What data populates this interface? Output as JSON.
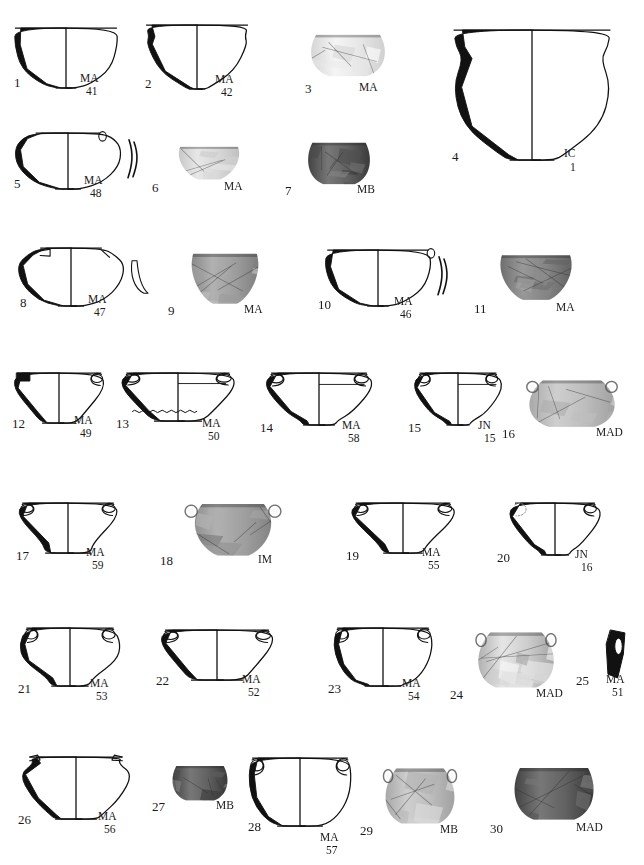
{
  "plate": {
    "header_fragment": "",
    "width": 644,
    "height": 865,
    "description": "Archaeological pottery catalogue plate: 30 vessels shown as section drawings or photographs",
    "site_codes": [
      "MA",
      "MB",
      "MAD",
      "IC",
      "IM",
      "JN"
    ]
  },
  "items": [
    {
      "num": "1",
      "site": "MA",
      "cat": "41",
      "kind": "drawing",
      "shape": "hemispherical-bowl",
      "x": 14,
      "y": 28,
      "w": 104,
      "h": 60,
      "numx": 0,
      "numy": 48,
      "sitex": 66,
      "sitey": 45,
      "catx": 72,
      "caty": 58
    },
    {
      "num": "2",
      "site": "MA",
      "cat": "42",
      "kind": "drawing",
      "shape": "carinated-bowl",
      "x": 145,
      "y": 25,
      "w": 104,
      "h": 64,
      "numx": 0,
      "numy": 52,
      "sitex": 70,
      "sitey": 49,
      "catx": 76,
      "caty": 62
    },
    {
      "num": "3",
      "site": "MA",
      "cat": "",
      "kind": "photo",
      "tone": "very-light",
      "shape": "jar-photo",
      "x": 305,
      "y": 30,
      "w": 86,
      "h": 48,
      "numx": 0,
      "numy": 52,
      "sitex": 54,
      "sitey": 52,
      "catx": 0,
      "caty": 0
    },
    {
      "num": "4",
      "site": "IC",
      "cat": "1",
      "kind": "drawing",
      "shape": "large-necked-jar",
      "x": 452,
      "y": 30,
      "w": 160,
      "h": 130,
      "numx": 0,
      "numy": 120,
      "sitex": 112,
      "sitey": 118,
      "catx": 118,
      "caty": 132
    },
    {
      "num": "5",
      "site": "MA",
      "cat": "48",
      "kind": "drawing",
      "shape": "lugged-bowl-profile",
      "x": 14,
      "y": 133,
      "w": 108,
      "h": 56,
      "numx": 0,
      "numy": 44,
      "sitex": 70,
      "sitey": 42,
      "catx": 76,
      "caty": 55
    },
    {
      "num": "6",
      "site": "MA",
      "cat": "",
      "kind": "photo",
      "tone": "light",
      "shape": "shallow-bowl-photo",
      "x": 170,
      "y": 143,
      "w": 78,
      "h": 38,
      "numx": -18,
      "numy": 38,
      "sitex": 54,
      "sitey": 38,
      "catx": 0,
      "caty": 0
    },
    {
      "num": "7",
      "site": "MB",
      "cat": "",
      "kind": "photo",
      "tone": "dark",
      "shape": "globular-pot-photo",
      "x": 303,
      "y": 138,
      "w": 72,
      "h": 48,
      "numx": -18,
      "numy": 46,
      "sitex": 54,
      "sitey": 46,
      "catx": 0,
      "caty": 0
    },
    {
      "num": "8",
      "site": "MA",
      "cat": "47",
      "kind": "drawing",
      "shape": "lug-handled-bowl",
      "x": 16,
      "y": 248,
      "w": 110,
      "h": 58,
      "numx": 4,
      "numy": 48,
      "sitex": 72,
      "sitey": 46,
      "catx": 78,
      "caty": 59
    },
    {
      "num": "9",
      "site": "MA",
      "cat": "",
      "kind": "photo",
      "tone": "mid",
      "shape": "footed-bowl-photo",
      "x": 182,
      "y": 248,
      "w": 86,
      "h": 58,
      "numx": -14,
      "numy": 56,
      "sitex": 62,
      "sitey": 56,
      "catx": 0,
      "caty": 0
    },
    {
      "num": "10",
      "site": "MA",
      "cat": "46",
      "kind": "drawing",
      "shape": "rim-handled-bowl",
      "x": 324,
      "y": 250,
      "w": 108,
      "h": 56,
      "numx": -6,
      "numy": 48,
      "sitex": 70,
      "sitey": 46,
      "catx": 76,
      "caty": 59
    },
    {
      "num": "11",
      "site": "MA",
      "cat": "",
      "kind": "photo",
      "tone": "mid-dark",
      "shape": "deep-bowl-photo",
      "x": 490,
      "y": 250,
      "w": 92,
      "h": 52,
      "numx": -16,
      "numy": 52,
      "sitex": 66,
      "sitey": 52,
      "catx": 0,
      "caty": 0
    },
    {
      "num": "12",
      "site": "MA",
      "cat": "49",
      "kind": "drawing",
      "shape": "square-lug-cup",
      "x": 12,
      "y": 373,
      "w": 94,
      "h": 50,
      "numx": 0,
      "numy": 44,
      "sitex": 62,
      "sitey": 42,
      "catx": 68,
      "caty": 55
    },
    {
      "num": "13",
      "site": "MA",
      "cat": "50",
      "kind": "drawing",
      "shape": "two-handled-shallow-bowl",
      "x": 118,
      "y": 373,
      "w": 120,
      "h": 48,
      "numx": -2,
      "numy": 44,
      "sitex": 84,
      "sitey": 45,
      "catx": 90,
      "caty": 58
    },
    {
      "num": "14",
      "site": "MA",
      "cat": "58",
      "kind": "drawing",
      "shape": "two-handled-footed-cup",
      "x": 262,
      "y": 373,
      "w": 114,
      "h": 52,
      "numx": -2,
      "numy": 48,
      "sitex": 80,
      "sitey": 47,
      "catx": 86,
      "caty": 60
    },
    {
      "num": "15",
      "site": "JN",
      "cat": "15",
      "kind": "drawing",
      "shape": "two-handled-cup",
      "x": 410,
      "y": 373,
      "w": 96,
      "h": 52,
      "numx": -2,
      "numy": 48,
      "sitex": 68,
      "sitey": 47,
      "catx": 74,
      "caty": 60
    },
    {
      "num": "16",
      "site": "MAD",
      "cat": "",
      "kind": "photo",
      "tone": "mid-light",
      "shape": "two-handled-jar-photo",
      "x": 520,
      "y": 375,
      "w": 104,
      "h": 54,
      "numx": -18,
      "numy": 52,
      "sitex": 76,
      "sitey": 52,
      "catx": 0,
      "caty": 0
    },
    {
      "num": "17",
      "site": "MA",
      "cat": "59",
      "kind": "drawing",
      "shape": "two-handled-carinated-cup",
      "x": 16,
      "y": 503,
      "w": 104,
      "h": 50,
      "numx": 0,
      "numy": 46,
      "sitex": 70,
      "sitey": 44,
      "catx": 76,
      "caty": 57
    },
    {
      "num": "18",
      "site": "IM",
      "cat": "",
      "kind": "photo",
      "tone": "mid",
      "shape": "lugged-bowl-photo",
      "x": 178,
      "y": 498,
      "w": 110,
      "h": 60,
      "numx": -18,
      "numy": 56,
      "sitex": 80,
      "sitey": 56,
      "catx": 0,
      "caty": 0
    },
    {
      "num": "19",
      "site": "MA",
      "cat": "55",
      "kind": "drawing",
      "shape": "two-handled-bowl",
      "x": 348,
      "y": 503,
      "w": 110,
      "h": 50,
      "numx": -2,
      "numy": 46,
      "sitex": 74,
      "sitey": 44,
      "catx": 80,
      "caty": 57
    },
    {
      "num": "20",
      "site": "JN",
      "cat": "16",
      "kind": "drawing",
      "shape": "two-handled-cup-dotted",
      "x": 505,
      "y": 503,
      "w": 100,
      "h": 52,
      "numx": -8,
      "numy": 48,
      "sitex": 70,
      "sitey": 46,
      "catx": 76,
      "caty": 59
    },
    {
      "num": "21",
      "site": "MA",
      "cat": "53",
      "kind": "drawing",
      "shape": "two-handled-deep-cup",
      "x": 18,
      "y": 628,
      "w": 104,
      "h": 58,
      "numx": 0,
      "numy": 54,
      "sitex": 72,
      "sitey": 50,
      "catx": 78,
      "caty": 63
    },
    {
      "num": "22",
      "site": "MA",
      "cat": "52",
      "kind": "drawing",
      "shape": "two-handled-shallow-cup",
      "x": 158,
      "y": 630,
      "w": 118,
      "h": 50,
      "numx": -2,
      "numy": 44,
      "sitex": 84,
      "sitey": 44,
      "catx": 90,
      "caty": 57
    },
    {
      "num": "23",
      "site": "MA",
      "cat": "54",
      "kind": "drawing",
      "shape": "two-handled-straight-cup",
      "x": 332,
      "y": 628,
      "w": 102,
      "h": 58,
      "numx": -4,
      "numy": 54,
      "sitex": 70,
      "sitey": 50,
      "catx": 76,
      "caty": 63
    },
    {
      "num": "24",
      "site": "MAD",
      "cat": "",
      "kind": "photo",
      "tone": "light-mottled",
      "shape": "two-handled-jar-photo",
      "x": 470,
      "y": 626,
      "w": 92,
      "h": 64,
      "numx": -20,
      "numy": 62,
      "sitex": 66,
      "sitey": 62,
      "catx": 0,
      "caty": 0
    },
    {
      "num": "25",
      "site": "MA",
      "cat": "51",
      "kind": "drawing",
      "shape": "handle-fragment",
      "x": 604,
      "y": 630,
      "w": 22,
      "h": 48,
      "numx": -28,
      "numy": 44,
      "sitex": 2,
      "sitey": 44,
      "catx": 8,
      "caty": 57
    },
    {
      "num": "26",
      "site": "MA",
      "cat": "56",
      "kind": "drawing",
      "shape": "two-lug-deep-bowl",
      "x": 18,
      "y": 757,
      "w": 116,
      "h": 62,
      "numx": 0,
      "numy": 56,
      "sitex": 80,
      "sitey": 54,
      "catx": 86,
      "caty": 67
    },
    {
      "num": "27",
      "site": "MB",
      "cat": "",
      "kind": "photo",
      "tone": "dark",
      "shape": "small-pot-photo",
      "x": 168,
      "y": 762,
      "w": 64,
      "h": 40,
      "numx": -16,
      "numy": 38,
      "sitex": 48,
      "sitey": 38,
      "catx": 0,
      "caty": 0
    },
    {
      "num": "28",
      "site": "MA",
      "cat": "57",
      "kind": "drawing",
      "shape": "two-handled-bowl-tall",
      "x": 248,
      "y": 758,
      "w": 104,
      "h": 68,
      "numx": 0,
      "numy": 62,
      "sitex": 72,
      "sitey": 74,
      "catx": 78,
      "caty": 87
    },
    {
      "num": "29",
      "site": "MB",
      "cat": "",
      "kind": "photo",
      "tone": "mid-light",
      "shape": "two-handled-jar-photo",
      "x": 378,
      "y": 762,
      "w": 84,
      "h": 64,
      "numx": -18,
      "numy": 62,
      "sitex": 62,
      "sitey": 62,
      "catx": 0,
      "caty": 0
    },
    {
      "num": "30",
      "site": "MAD",
      "cat": "",
      "kind": "photo",
      "tone": "dark",
      "shape": "globular-jar-photo",
      "x": 508,
      "y": 762,
      "w": 92,
      "h": 60,
      "numx": -18,
      "numy": 60,
      "sitex": 68,
      "sitey": 60,
      "catx": 0,
      "caty": 0
    }
  ]
}
